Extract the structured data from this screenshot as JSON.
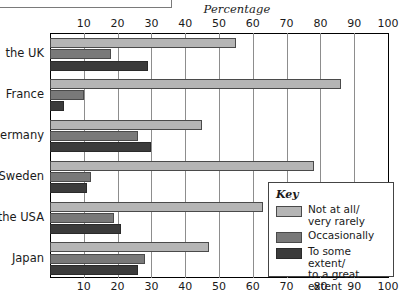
{
  "axis_title": "Percentage",
  "legend": {
    "title": "Key",
    "items": [
      {
        "label": "Not at all/\nvery rarely",
        "color": "#b5b5b5"
      },
      {
        "label": "Occasionally",
        "color": "#797979"
      },
      {
        "label": "To some extent/\nto a great extent",
        "color": "#3b3b3b"
      }
    ]
  },
  "chart_data": {
    "type": "bar",
    "title": "",
    "xlabel": "Percentage",
    "ylabel": "",
    "orientation": "horizontal",
    "xlim": [
      0,
      100
    ],
    "ticks": [
      0,
      10,
      20,
      30,
      40,
      50,
      60,
      70,
      80,
      90,
      100
    ],
    "tick_labels": [
      "",
      "10",
      "20",
      "30",
      "40",
      "50",
      "60",
      "70",
      "80",
      "90",
      "100"
    ],
    "grid": true,
    "legend_position": "inside-right",
    "categories": [
      "the UK",
      "France",
      "Germany",
      "Sweden",
      "the USA",
      "Japan"
    ],
    "series": [
      {
        "name": "Not at all/very rarely",
        "color": "#b5b5b5",
        "values": [
          55,
          86,
          45,
          78,
          63,
          47
        ]
      },
      {
        "name": "Occasionally",
        "color": "#797979",
        "values": [
          18,
          10,
          26,
          12,
          19,
          28
        ]
      },
      {
        "name": "To some extent/to a great extent",
        "color": "#3b3b3b",
        "values": [
          29,
          4,
          30,
          11,
          21,
          26
        ]
      }
    ]
  }
}
